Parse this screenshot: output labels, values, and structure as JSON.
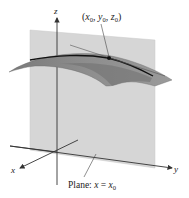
{
  "figure": {
    "point_label": "(x₀, y₀, z₀)",
    "point_label_parts": {
      "open": "(",
      "x": "x",
      "x_sub": "0",
      "y": "y",
      "y_sub": "0",
      "z": "z",
      "z_sub": "0",
      "sep": ", ",
      "close": ")"
    },
    "axes": {
      "x_label": "x",
      "y_label": "y",
      "z_label": "z"
    },
    "plane_caption": {
      "prefix": "Plane:",
      "var": "x",
      "eq": " = ",
      "rhs": "x",
      "rhs_sub": "0"
    },
    "colors": {
      "plane": "#d4d4d4",
      "surface_top": "#8a8a8a",
      "surface_under": "#6f6f6f",
      "curve": "#111111",
      "axis": "#333333"
    }
  }
}
